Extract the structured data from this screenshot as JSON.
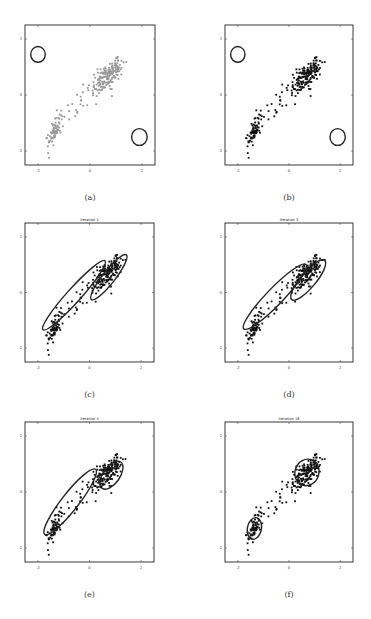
{
  "figure": {
    "panels": [
      {
        "id": "a",
        "caption": "(a)",
        "title": "",
        "point_color": "#999999",
        "mode": "init",
        "box": {
          "x": 25,
          "y": 25,
          "w": 130,
          "h": 140
        }
      },
      {
        "id": "b",
        "caption": "(b)",
        "title": "",
        "point_color": "#111111",
        "mode": "init",
        "box": {
          "x": 225,
          "y": 25,
          "w": 128,
          "h": 140
        }
      },
      {
        "id": "c",
        "caption": "(c)",
        "title": "Iteration 1",
        "point_color": "#111111",
        "mode": "iter1",
        "box": {
          "x": 25,
          "y": 223,
          "w": 129,
          "h": 139
        }
      },
      {
        "id": "d",
        "caption": "(d)",
        "title": "Iteration 3",
        "point_color": "#111111",
        "mode": "iter3",
        "box": {
          "x": 225,
          "y": 223,
          "w": 128,
          "h": 139
        }
      },
      {
        "id": "e",
        "caption": "(e)",
        "title": "Iteration 5",
        "point_color": "#111111",
        "mode": "iter5",
        "box": {
          "x": 25,
          "y": 422,
          "w": 129,
          "h": 140
        }
      },
      {
        "id": "f",
        "caption": "(f)",
        "title": "Iteration 16",
        "point_color": "#111111",
        "mode": "iter16",
        "box": {
          "x": 225,
          "y": 422,
          "w": 128,
          "h": 140
        }
      }
    ]
  },
  "chart_data": [
    {
      "type": "scatter",
      "title": "",
      "caption": "(a)",
      "xlabel": "",
      "ylabel": "",
      "xlim": [
        -2.5,
        2.5
      ],
      "ylim": [
        -2.5,
        2.5
      ],
      "xticks": [
        -2,
        0,
        2
      ],
      "yticks": [
        -2,
        0,
        2
      ],
      "grid": false,
      "clusters": [
        {
          "name": "upper-right cluster",
          "center": [
            0.6,
            0.7
          ],
          "n_approx": 180
        },
        {
          "name": "lower-left cluster",
          "center": [
            -1.4,
            -1.3
          ],
          "n_approx": 80
        }
      ],
      "components": [
        {
          "center": [
            -2.0,
            1.45
          ],
          "rx": 0.28,
          "ry": 0.28
        },
        {
          "center": [
            1.9,
            -1.5
          ],
          "rx": 0.3,
          "ry": 0.3
        }
      ]
    },
    {
      "type": "scatter",
      "title": "",
      "caption": "(b)",
      "xlim": [
        -2.5,
        2.5
      ],
      "ylim": [
        -2.5,
        2.5
      ],
      "xticks": [
        -2,
        0,
        2
      ],
      "yticks": [
        -2,
        0,
        2
      ],
      "components": [
        {
          "center": [
            -2.0,
            1.45
          ],
          "rx": 0.28,
          "ry": 0.28
        },
        {
          "center": [
            1.9,
            -1.5
          ],
          "rx": 0.3,
          "ry": 0.3
        }
      ]
    },
    {
      "type": "scatter",
      "title": "Iteration 1",
      "caption": "(c)",
      "xlim": [
        -2.5,
        2.5
      ],
      "ylim": [
        -2.5,
        2.5
      ],
      "xticks": [
        -2,
        0,
        2
      ],
      "yticks": [
        -2,
        0,
        2
      ],
      "components": [
        {
          "center": [
            -0.6,
            -0.1
          ],
          "length": 3.6,
          "width": 0.5,
          "angle_deg": 48
        },
        {
          "center": [
            0.75,
            0.55
          ],
          "length": 2.2,
          "width": 0.45,
          "angle_deg": 52
        }
      ]
    },
    {
      "type": "scatter",
      "title": "Iteration 3",
      "caption": "(d)",
      "xlim": [
        -2.5,
        2.5
      ],
      "ylim": [
        -2.5,
        2.5
      ],
      "xticks": [
        -2,
        0,
        2
      ],
      "yticks": [
        -2,
        0,
        2
      ],
      "components": [
        {
          "center": [
            -0.55,
            -0.15
          ],
          "length": 3.5,
          "width": 0.6,
          "angle_deg": 46
        },
        {
          "center": [
            0.75,
            0.45
          ],
          "length": 2.0,
          "width": 0.55,
          "angle_deg": 50
        }
      ]
    },
    {
      "type": "scatter",
      "title": "Iteration 5",
      "caption": "(e)",
      "xlim": [
        -2.5,
        2.5
      ],
      "ylim": [
        -2.5,
        2.5
      ],
      "xticks": [
        -2,
        0,
        2
      ],
      "yticks": [
        -2,
        0,
        2
      ],
      "components": [
        {
          "center": [
            -0.75,
            -0.35
          ],
          "length": 3.2,
          "width": 0.6,
          "angle_deg": 52
        },
        {
          "center": [
            0.85,
            0.6
          ],
          "length": 1.25,
          "width": 0.6,
          "angle_deg": 55
        }
      ]
    },
    {
      "type": "scatter",
      "title": "Iteration 16",
      "caption": "(f)",
      "xlim": [
        -2.5,
        2.5
      ],
      "ylim": [
        -2.5,
        2.5
      ],
      "xticks": [
        -2,
        0,
        2
      ],
      "yticks": [
        -2,
        0,
        2
      ],
      "components": [
        {
          "center": [
            -1.35,
            -1.3
          ],
          "length": 0.85,
          "width": 0.5,
          "angle_deg": 80
        },
        {
          "center": [
            0.7,
            0.7
          ],
          "length": 1.05,
          "width": 0.85,
          "angle_deg": 70
        }
      ]
    }
  ]
}
